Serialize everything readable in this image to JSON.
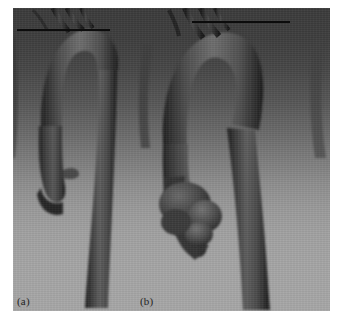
{
  "figure": {
    "kind": "grayscale 3d volume rendering",
    "width": 342,
    "height": 326,
    "panel_count": 2
  },
  "panels": [
    {
      "id": "a",
      "label": "(a)",
      "label_x": 17,
      "label_y": 296,
      "description": "narrow aortic arch with ascending aorta, supra-aortic branch vessels and descending aorta",
      "reference_line": {
        "x": 17,
        "y": 29,
        "width": 93,
        "color": "#0c0c0c"
      }
    },
    {
      "id": "b",
      "label": "(b)",
      "label_x": 140,
      "label_y": 296,
      "description": "wide aortic arch with lobulated aneurysmal bulge on the ascending aorta",
      "reference_line": {
        "x": 192,
        "y": 21,
        "width": 98,
        "color": "#0c0c0c"
      }
    }
  ],
  "colors": {
    "background_top": "#3b3b3b",
    "background_bottom": "#a7a7a7",
    "vessel_dark": "#2b2b2b",
    "vessel_mid": "#565656",
    "vessel_light": "#7e7e7e",
    "line": "#0c0c0c",
    "label_text": "#242424",
    "page": "#ffffff"
  },
  "canvas": {
    "x": 13,
    "y": 8,
    "width": 317,
    "height": 303
  }
}
